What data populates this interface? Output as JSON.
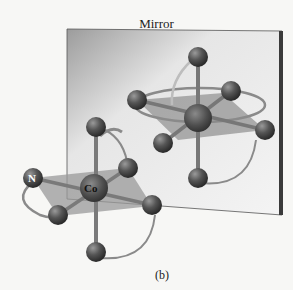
{
  "figure": {
    "mirror_label": "Mirror",
    "caption": "(b)",
    "central_atom_label": "Co",
    "ligand_atom_label": "N"
  },
  "colors": {
    "background": "#f7f7f5",
    "mirror_dark": "#a9a9a9",
    "mirror_light": "#f2f2f2",
    "mirror_frame": "#3a3a3a",
    "atom": "#4a4a4a",
    "bond": "#7a7a7a",
    "plane": "#9a9a9a",
    "chelate_ring": "#8a8a8a"
  }
}
